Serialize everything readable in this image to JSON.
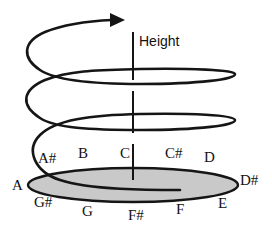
{
  "diagram": {
    "axis_label": "Height",
    "colors": {
      "stroke": "#151515",
      "chroma_circle_fill": "#c9c9c9",
      "background": "#ffffff"
    },
    "pitch_classes": [
      {
        "name": "A",
        "x": 12,
        "y": 190
      },
      {
        "name": "A#",
        "x": 38,
        "y": 163
      },
      {
        "name": "B",
        "x": 78,
        "y": 158
      },
      {
        "name": "C",
        "x": 120,
        "y": 158
      },
      {
        "name": "C#",
        "x": 165,
        "y": 158
      },
      {
        "name": "D",
        "x": 204,
        "y": 162
      },
      {
        "name": "D#",
        "x": 240,
        "y": 185
      },
      {
        "name": "E",
        "x": 218,
        "y": 208
      },
      {
        "name": "F",
        "x": 176,
        "y": 214
      },
      {
        "name": "F#",
        "x": 128,
        "y": 220
      },
      {
        "name": "G",
        "x": 82,
        "y": 216
      },
      {
        "name": "G#",
        "x": 34,
        "y": 207
      }
    ]
  }
}
